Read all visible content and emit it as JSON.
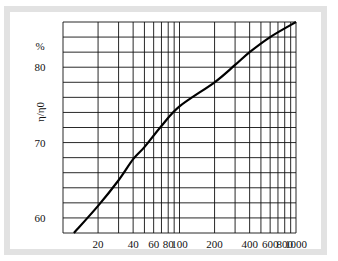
{
  "chart_data": {
    "type": "line",
    "title": "",
    "xlabel": "",
    "ylabel": "η/η0",
    "yunit": "%",
    "xscale": "log",
    "xlim": [
      10,
      1000
    ],
    "ylim": [
      58,
      86
    ],
    "grid": true,
    "x_tick_labels": [
      "20",
      "40",
      "60",
      "80",
      "100",
      "200",
      "400",
      "600",
      "800",
      "1000"
    ],
    "y_tick_labels": [
      "60",
      "70",
      "80"
    ],
    "series": [
      {
        "name": "η/η0",
        "x": [
          12.4,
          20,
          30,
          40,
          50,
          70,
          100,
          200,
          300,
          400,
          600,
          1000
        ],
        "y": [
          58.0,
          61.6,
          65.0,
          67.8,
          69.4,
          72.2,
          74.8,
          78.0,
          80.3,
          82.0,
          84.0,
          86.0
        ]
      }
    ],
    "colors": {
      "line": "#000000",
      "grid": "#111111",
      "frame": "#e2e2e2"
    }
  }
}
